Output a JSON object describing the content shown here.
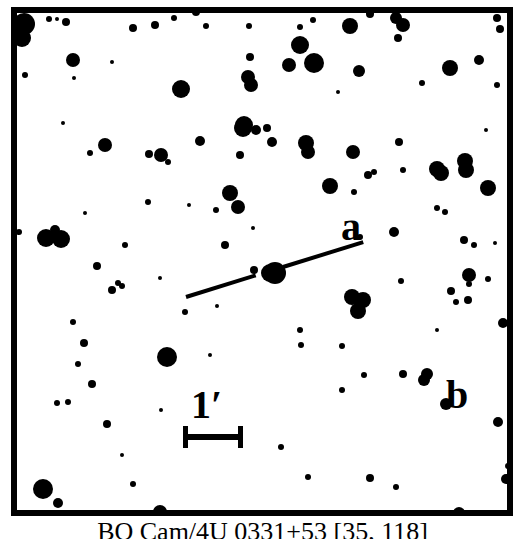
{
  "caption": {
    "text": "BQ Cam/4U 0331+53 [35, 118]"
  },
  "labels": {
    "object_a": "a",
    "object_b": "b"
  },
  "scalebar": {
    "label": "1′",
    "value": "1",
    "unit": "arcmin"
  },
  "colors": {
    "ink": "#000000",
    "sky": "#ffffff"
  },
  "chart_data": {
    "type": "scatter",
    "title": "BQ Cam/4U 0331+53 [35, 118]",
    "xlabel": "",
    "ylabel": "",
    "grid": false,
    "legend": null,
    "axis_units": "pixels (image coordinates, origin at frame top-left)",
    "field_box": {
      "x": 11,
      "y": 7,
      "width": 502,
      "height": 509
    },
    "scale_bar": {
      "label": "1′",
      "x_start": 183,
      "x_end": 243,
      "y": 437,
      "length_px": 60,
      "arcmin_per_px": 0.01667
    },
    "target": {
      "name": "BQ Cam / 4U 0331+53",
      "x": 270,
      "y": 273,
      "r": 9,
      "marker": "pointer-line-gap"
    },
    "pointer_line": {
      "x1": 186,
      "y1": 297,
      "x2": 363,
      "y2": 242,
      "gap_center_x": 270,
      "gap_center_y": 273,
      "gap_radius": 14,
      "thickness": 4
    },
    "annotations": [
      {
        "text": "a",
        "x": 341,
        "y": 207,
        "refers_to_star": {
          "x": 330,
          "y": 186,
          "r": 8
        }
      },
      {
        "text": "b",
        "x": 446,
        "y": 375,
        "refers_to_star": {
          "x": 427,
          "y": 374,
          "r": 6
        }
      }
    ],
    "stars": [
      {
        "x": 24,
        "y": 24,
        "r": 11
      },
      {
        "x": 22,
        "y": 38,
        "r": 9
      },
      {
        "x": 49,
        "y": 19,
        "r": 3
      },
      {
        "x": 57,
        "y": 19,
        "r": 2
      },
      {
        "x": 66,
        "y": 22,
        "r": 4
      },
      {
        "x": 155,
        "y": 25,
        "r": 4
      },
      {
        "x": 133,
        "y": 28,
        "r": 4
      },
      {
        "x": 196,
        "y": 12,
        "r": 4
      },
      {
        "x": 174,
        "y": 18,
        "r": 3
      },
      {
        "x": 206,
        "y": 26,
        "r": 3
      },
      {
        "x": 73,
        "y": 60,
        "r": 7
      },
      {
        "x": 25,
        "y": 75,
        "r": 3
      },
      {
        "x": 74,
        "y": 78,
        "r": 2
      },
      {
        "x": 181,
        "y": 89,
        "r": 9
      },
      {
        "x": 250,
        "y": 57,
        "r": 4
      },
      {
        "x": 248,
        "y": 78,
        "r": 3
      },
      {
        "x": 249,
        "y": 26,
        "r": 3
      },
      {
        "x": 300,
        "y": 27,
        "r": 3
      },
      {
        "x": 313,
        "y": 20,
        "r": 3
      },
      {
        "x": 370,
        "y": 14,
        "r": 4
      },
      {
        "x": 350,
        "y": 26,
        "r": 8
      },
      {
        "x": 396,
        "y": 18,
        "r": 6
      },
      {
        "x": 403,
        "y": 25,
        "r": 7
      },
      {
        "x": 398,
        "y": 38,
        "r": 4
      },
      {
        "x": 497,
        "y": 18,
        "r": 4
      },
      {
        "x": 500,
        "y": 29,
        "r": 4
      },
      {
        "x": 300,
        "y": 45,
        "r": 9
      },
      {
        "x": 289,
        "y": 65,
        "r": 7
      },
      {
        "x": 314,
        "y": 63,
        "r": 10
      },
      {
        "x": 359,
        "y": 71,
        "r": 6
      },
      {
        "x": 450,
        "y": 68,
        "r": 8
      },
      {
        "x": 479,
        "y": 60,
        "r": 5
      },
      {
        "x": 422,
        "y": 83,
        "r": 3
      },
      {
        "x": 497,
        "y": 85,
        "r": 3
      },
      {
        "x": 251,
        "y": 85,
        "r": 7
      },
      {
        "x": 248,
        "y": 77,
        "r": 7
      },
      {
        "x": 243,
        "y": 128,
        "r": 9
      },
      {
        "x": 256,
        "y": 130,
        "r": 5
      },
      {
        "x": 262,
        "y": 7,
        "r": 3
      },
      {
        "x": 244,
        "y": 125,
        "r": 9
      },
      {
        "x": 181,
        "y": 89,
        "r": 8
      },
      {
        "x": 105,
        "y": 145,
        "r": 7
      },
      {
        "x": 267,
        "y": 128,
        "r": 4
      },
      {
        "x": 200,
        "y": 141,
        "r": 5
      },
      {
        "x": 161,
        "y": 155,
        "r": 7
      },
      {
        "x": 90,
        "y": 153,
        "r": 3
      },
      {
        "x": 168,
        "y": 162,
        "r": 3
      },
      {
        "x": 240,
        "y": 155,
        "r": 4
      },
      {
        "x": 149,
        "y": 154,
        "r": 4
      },
      {
        "x": 306,
        "y": 143,
        "r": 8
      },
      {
        "x": 308,
        "y": 152,
        "r": 7
      },
      {
        "x": 353,
        "y": 152,
        "r": 7
      },
      {
        "x": 330,
        "y": 186,
        "r": 8
      },
      {
        "x": 368,
        "y": 175,
        "r": 4
      },
      {
        "x": 374,
        "y": 172,
        "r": 3
      },
      {
        "x": 403,
        "y": 170,
        "r": 3
      },
      {
        "x": 437,
        "y": 169,
        "r": 8
      },
      {
        "x": 441,
        "y": 173,
        "r": 8
      },
      {
        "x": 465,
        "y": 161,
        "r": 8
      },
      {
        "x": 466,
        "y": 170,
        "r": 8
      },
      {
        "x": 488,
        "y": 188,
        "r": 8
      },
      {
        "x": 399,
        "y": 142,
        "r": 4
      },
      {
        "x": 230,
        "y": 193,
        "r": 8
      },
      {
        "x": 238,
        "y": 207,
        "r": 7
      },
      {
        "x": 272,
        "y": 142,
        "r": 5
      },
      {
        "x": 148,
        "y": 202,
        "r": 3
      },
      {
        "x": 19,
        "y": 232,
        "r": 3
      },
      {
        "x": 55,
        "y": 230,
        "r": 5
      },
      {
        "x": 46,
        "y": 238,
        "r": 9
      },
      {
        "x": 61,
        "y": 239,
        "r": 9
      },
      {
        "x": 125,
        "y": 245,
        "r": 3
      },
      {
        "x": 225,
        "y": 245,
        "r": 4
      },
      {
        "x": 354,
        "y": 192,
        "r": 3
      },
      {
        "x": 437,
        "y": 208,
        "r": 3
      },
      {
        "x": 445,
        "y": 212,
        "r": 3
      },
      {
        "x": 394,
        "y": 232,
        "r": 5
      },
      {
        "x": 360,
        "y": 237,
        "r": 3
      },
      {
        "x": 464,
        "y": 240,
        "r": 4
      },
      {
        "x": 474,
        "y": 245,
        "r": 3
      },
      {
        "x": 97,
        "y": 266,
        "r": 4
      },
      {
        "x": 118,
        "y": 283,
        "r": 3
      },
      {
        "x": 112,
        "y": 290,
        "r": 4
      },
      {
        "x": 122,
        "y": 286,
        "r": 3
      },
      {
        "x": 254,
        "y": 270,
        "r": 4
      },
      {
        "x": 275,
        "y": 273,
        "r": 11
      },
      {
        "x": 352,
        "y": 297,
        "r": 8
      },
      {
        "x": 363,
        "y": 300,
        "r": 8
      },
      {
        "x": 358,
        "y": 311,
        "r": 8
      },
      {
        "x": 401,
        "y": 281,
        "r": 3
      },
      {
        "x": 451,
        "y": 291,
        "r": 4
      },
      {
        "x": 469,
        "y": 284,
        "r": 3
      },
      {
        "x": 456,
        "y": 302,
        "r": 3
      },
      {
        "x": 468,
        "y": 300,
        "r": 4
      },
      {
        "x": 469,
        "y": 275,
        "r": 7
      },
      {
        "x": 488,
        "y": 279,
        "r": 3
      },
      {
        "x": 503,
        "y": 323,
        "r": 5
      },
      {
        "x": 73,
        "y": 322,
        "r": 3
      },
      {
        "x": 84,
        "y": 343,
        "r": 4
      },
      {
        "x": 78,
        "y": 364,
        "r": 3
      },
      {
        "x": 92,
        "y": 384,
        "r": 4
      },
      {
        "x": 68,
        "y": 402,
        "r": 3
      },
      {
        "x": 57,
        "y": 403,
        "r": 3
      },
      {
        "x": 107,
        "y": 424,
        "r": 4
      },
      {
        "x": 167,
        "y": 357,
        "r": 10
      },
      {
        "x": 185,
        "y": 312,
        "r": 3
      },
      {
        "x": 300,
        "y": 330,
        "r": 3
      },
      {
        "x": 161,
        "y": 410,
        "r": 2
      },
      {
        "x": 301,
        "y": 345,
        "r": 3
      },
      {
        "x": 342,
        "y": 346,
        "r": 3
      },
      {
        "x": 364,
        "y": 375,
        "r": 3
      },
      {
        "x": 342,
        "y": 390,
        "r": 3
      },
      {
        "x": 403,
        "y": 374,
        "r": 4
      },
      {
        "x": 427,
        "y": 374,
        "r": 6
      },
      {
        "x": 424,
        "y": 380,
        "r": 6
      },
      {
        "x": 446,
        "y": 404,
        "r": 6
      },
      {
        "x": 498,
        "y": 422,
        "r": 5
      },
      {
        "x": 506,
        "y": 479,
        "r": 5
      },
      {
        "x": 508,
        "y": 466,
        "r": 3
      },
      {
        "x": 370,
        "y": 478,
        "r": 4
      },
      {
        "x": 308,
        "y": 477,
        "r": 3
      },
      {
        "x": 133,
        "y": 484,
        "r": 3
      },
      {
        "x": 43,
        "y": 489,
        "r": 10
      },
      {
        "x": 58,
        "y": 503,
        "r": 5
      },
      {
        "x": 160,
        "y": 512,
        "r": 7
      },
      {
        "x": 459,
        "y": 513,
        "r": 6
      },
      {
        "x": 281,
        "y": 447,
        "r": 3
      },
      {
        "x": 396,
        "y": 487,
        "r": 3
      },
      {
        "x": 216,
        "y": 210,
        "r": 3
      },
      {
        "x": 112,
        "y": 62,
        "r": 2
      },
      {
        "x": 189,
        "y": 205,
        "r": 2
      },
      {
        "x": 253,
        "y": 228,
        "r": 2
      },
      {
        "x": 217,
        "y": 306,
        "r": 2
      },
      {
        "x": 160,
        "y": 278,
        "r": 2
      },
      {
        "x": 437,
        "y": 330,
        "r": 2
      },
      {
        "x": 486,
        "y": 130,
        "r": 2
      },
      {
        "x": 85,
        "y": 213,
        "r": 2
      },
      {
        "x": 63,
        "y": 123,
        "r": 2
      },
      {
        "x": 338,
        "y": 92,
        "r": 2
      },
      {
        "x": 495,
        "y": 243,
        "r": 2
      },
      {
        "x": 210,
        "y": 355,
        "r": 2
      },
      {
        "x": 122,
        "y": 455,
        "r": 2
      }
    ]
  }
}
